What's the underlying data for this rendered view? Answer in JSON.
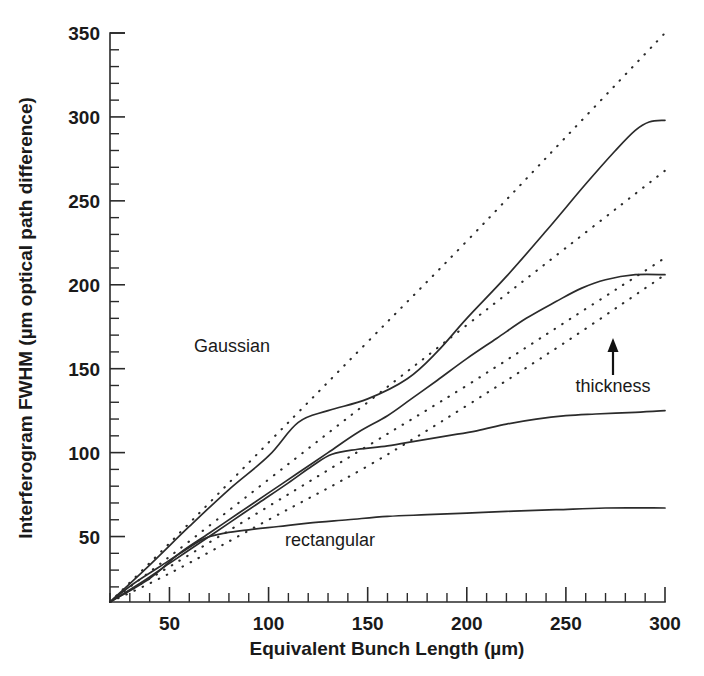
{
  "figure": {
    "background_color": "#ffffff",
    "ink_color": "#2b2b2b"
  },
  "chart_data": {
    "type": "line",
    "title": "",
    "xlabel": "Equivalent Bunch Length (µm)",
    "ylabel": "Interferogram FWHM (µm optical path difference)",
    "xlim": [
      20,
      300
    ],
    "ylim": [
      11,
      350
    ],
    "xticks": [
      50,
      100,
      150,
      200,
      250,
      300
    ],
    "xtick_labels": [
      "50",
      "100",
      "150",
      "200",
      "250",
      "300"
    ],
    "yticks": [
      50,
      100,
      150,
      200,
      250,
      300,
      350
    ],
    "ytick_labels": [
      "50",
      "100",
      "150",
      "200",
      "250",
      "300",
      "350"
    ],
    "x_minor_step": 10,
    "y_minor_step": 10,
    "grid": false,
    "legend": "none",
    "annotations": [
      {
        "name": "gaussian-label",
        "text": "Gaussian",
        "x": 68,
        "y": 178
      },
      {
        "name": "rectangular-label",
        "text": "rectangular",
        "x": 148,
        "y": 42
      },
      {
        "name": "thickness-label",
        "text": "thickness",
        "x": 262,
        "y": 150
      },
      {
        "name": "thickness-arrow",
        "text": "↑",
        "x": 262,
        "y": 172
      }
    ],
    "series": [
      {
        "name": "Gaussian ideal (thinnest)",
        "style": "dotted",
        "points": [
          [
            20,
            11
          ],
          [
            50,
            46
          ],
          [
            100,
            106
          ],
          [
            150,
            166
          ],
          [
            200,
            226
          ],
          [
            250,
            288
          ],
          [
            300,
            350
          ]
        ]
      },
      {
        "name": "Gaussian with thickness 2",
        "style": "dotted",
        "points": [
          [
            20,
            11
          ],
          [
            50,
            38
          ],
          [
            100,
            84
          ],
          [
            150,
            130
          ],
          [
            200,
            176
          ],
          [
            250,
            222
          ],
          [
            300,
            268
          ]
        ]
      },
      {
        "name": "Gaussian with thickness 3",
        "style": "dotted",
        "points": [
          [
            20,
            11
          ],
          [
            50,
            32
          ],
          [
            100,
            68
          ],
          [
            150,
            104
          ],
          [
            200,
            140
          ],
          [
            250,
            178
          ],
          [
            300,
            216
          ]
        ]
      },
      {
        "name": "Gaussian with thickness 4 (thickest)",
        "style": "dotted",
        "points": [
          [
            20,
            11
          ],
          [
            50,
            28
          ],
          [
            100,
            60
          ],
          [
            150,
            92
          ],
          [
            200,
            128
          ],
          [
            250,
            166
          ],
          [
            300,
            206
          ]
        ]
      },
      {
        "name": "rectangular thinnest",
        "style": "solid",
        "points": [
          [
            20,
            11
          ],
          [
            40,
            33
          ],
          [
            60,
            56
          ],
          [
            80,
            78
          ],
          [
            100,
            98
          ],
          [
            115,
            118
          ],
          [
            130,
            125
          ],
          [
            150,
            132
          ],
          [
            170,
            144
          ],
          [
            185,
            160
          ],
          [
            200,
            180
          ],
          [
            220,
            205
          ],
          [
            240,
            232
          ],
          [
            260,
            260
          ],
          [
            275,
            280
          ],
          [
            285,
            292
          ],
          [
            292,
            297
          ],
          [
            300,
            298
          ]
        ]
      },
      {
        "name": "rectangular thickness 2",
        "style": "solid",
        "points": [
          [
            20,
            11
          ],
          [
            40,
            25
          ],
          [
            55,
            40
          ],
          [
            70,
            52
          ],
          [
            85,
            64
          ],
          [
            100,
            76
          ],
          [
            115,
            88
          ],
          [
            130,
            100
          ],
          [
            145,
            112
          ],
          [
            160,
            122
          ],
          [
            172,
            132
          ],
          [
            185,
            143
          ],
          [
            200,
            156
          ],
          [
            215,
            168
          ],
          [
            230,
            180
          ],
          [
            245,
            190
          ],
          [
            258,
            198
          ],
          [
            270,
            203
          ],
          [
            285,
            206
          ],
          [
            300,
            206
          ]
        ]
      },
      {
        "name": "rectangular thickness 3",
        "style": "solid",
        "points": [
          [
            20,
            11
          ],
          [
            35,
            22
          ],
          [
            50,
            34
          ],
          [
            65,
            46
          ],
          [
            80,
            58
          ],
          [
            95,
            70
          ],
          [
            110,
            82
          ],
          [
            122,
            92
          ],
          [
            132,
            99
          ],
          [
            145,
            102
          ],
          [
            160,
            104
          ],
          [
            175,
            107
          ],
          [
            190,
            110
          ],
          [
            205,
            113
          ],
          [
            220,
            117
          ],
          [
            235,
            120
          ],
          [
            250,
            122
          ],
          [
            265,
            123
          ],
          [
            285,
            124
          ],
          [
            300,
            125
          ]
        ]
      },
      {
        "name": "rectangular thickest",
        "style": "solid",
        "points": [
          [
            20,
            11
          ],
          [
            32,
            22
          ],
          [
            45,
            32
          ],
          [
            58,
            42
          ],
          [
            68,
            49
          ],
          [
            78,
            52
          ],
          [
            90,
            54
          ],
          [
            105,
            56
          ],
          [
            120,
            58
          ],
          [
            140,
            60
          ],
          [
            160,
            62
          ],
          [
            180,
            63
          ],
          [
            200,
            64
          ],
          [
            220,
            65
          ],
          [
            245,
            66
          ],
          [
            270,
            67
          ],
          [
            300,
            67
          ]
        ]
      }
    ]
  },
  "axes_geometry": {
    "left_px": 110,
    "right_px": 665,
    "bottom_px": 602,
    "top_px": 33
  }
}
